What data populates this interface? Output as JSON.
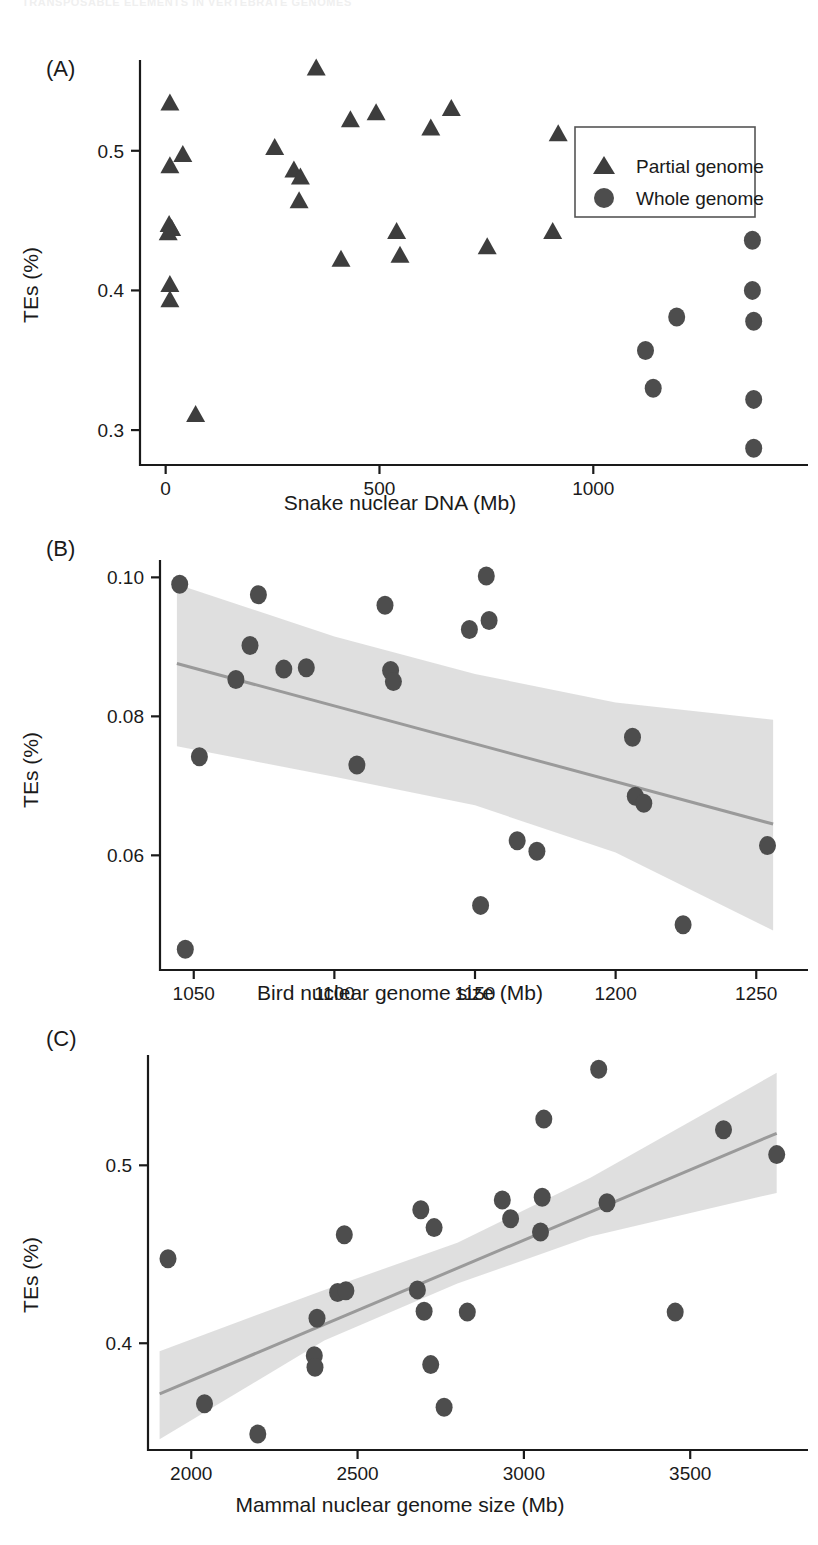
{
  "running_head": "TRANSPOSABLE ELEMENTS IN VERTEBRATE GENOMES",
  "figure": {
    "panels": [
      {
        "tag": "(A)",
        "xlabel": "Snake nuclear DNA (Mb)",
        "ylabel": "TEs (%)",
        "xticks": [
          "0",
          "500",
          "1000"
        ],
        "yticks": [
          "0.5",
          "0.4",
          "0.3"
        ],
        "legend": {
          "items": [
            {
              "label": "Partial genome",
              "marker": "triangle-marker"
            },
            {
              "label": "Whole genome",
              "marker": "circle-marker"
            }
          ]
        }
      },
      {
        "tag": "(B)",
        "xlabel": "Bird nuclear genome size (Mb)",
        "ylabel": "TEs (%)",
        "xticks": [
          "1050",
          "1100",
          "1150",
          "1200",
          "1250"
        ],
        "yticks": [
          "0.10",
          "0.08",
          "0.06"
        ]
      },
      {
        "tag": "(C)",
        "xlabel": "Mammal nuclear genome size (Mb)",
        "ylabel": "TEs (%)",
        "xticks": [
          "2000",
          "2500",
          "3000",
          "3500"
        ],
        "yticks": [
          "0.5",
          "0.4"
        ]
      }
    ]
  },
  "colors": {
    "marker": "#4d4d4d",
    "fit_line": "#9a9a9a",
    "ci_band": "#d9d9d9",
    "axis": "#1a1a1a"
  },
  "chart_data": [
    {
      "type": "scatter",
      "title": "(A)",
      "xlabel": "Snake nuclear DNA (Mb)",
      "ylabel": "TEs (%)",
      "xlim": [
        -60,
        1460
      ],
      "ylim": [
        0.275,
        0.565
      ],
      "xticks": [
        0,
        500,
        1000
      ],
      "yticks": [
        0.3,
        0.4,
        0.5
      ],
      "grid": false,
      "legend_position": "top-right",
      "series": [
        {
          "name": "Partial genome",
          "marker": "triangle",
          "points": [
            [
              10,
              0.534
            ],
            [
              10,
              0.489
            ],
            [
              40,
              0.497
            ],
            [
              8,
              0.447
            ],
            [
              14,
              0.444
            ],
            [
              6,
              0.441
            ],
            [
              10,
              0.404
            ],
            [
              10,
              0.393
            ],
            [
              70,
              0.311
            ],
            [
              255,
              0.502
            ],
            [
              300,
              0.486
            ],
            [
              315,
              0.481
            ],
            [
              312,
              0.464
            ],
            [
              352,
              0.559
            ],
            [
              410,
              0.422
            ],
            [
              432,
              0.522
            ],
            [
              492,
              0.527
            ],
            [
              540,
              0.442
            ],
            [
              548,
              0.425
            ],
            [
              620,
              0.516
            ],
            [
              668,
              0.53
            ],
            [
              752,
              0.431
            ],
            [
              905,
              0.442
            ],
            [
              918,
              0.512
            ]
          ]
        },
        {
          "name": "Whole genome",
          "marker": "circle",
          "points": [
            [
              1122,
              0.357
            ],
            [
              1140,
              0.33
            ],
            [
              1195,
              0.381
            ],
            [
              1372,
              0.436
            ],
            [
              1372,
              0.4
            ],
            [
              1375,
              0.378
            ],
            [
              1375,
              0.322
            ],
            [
              1375,
              0.287
            ]
          ]
        }
      ]
    },
    {
      "type": "scatter",
      "title": "(B)",
      "xlabel": "Bird nuclear genome size (Mb)",
      "ylabel": "TEs (%)",
      "xlim": [
        1038,
        1262
      ],
      "ylim": [
        0.0435,
        0.1025
      ],
      "xticks": [
        1050,
        1100,
        1150,
        1200,
        1250
      ],
      "yticks": [
        0.06,
        0.08,
        0.1
      ],
      "grid": false,
      "regression": {
        "line": [
          [
            1044,
            0.0876
          ],
          [
            1256,
            0.0645
          ]
        ],
        "ci_upper": [
          [
            1044,
            0.099
          ],
          [
            1100,
            0.0915
          ],
          [
            1150,
            0.0861
          ],
          [
            1200,
            0.082
          ],
          [
            1256,
            0.0795
          ]
        ],
        "ci_lower": [
          [
            1044,
            0.0757
          ],
          [
            1100,
            0.0713
          ],
          [
            1150,
            0.0672
          ],
          [
            1200,
            0.0604
          ],
          [
            1256,
            0.0492
          ]
        ]
      },
      "series": [
        {
          "name": "Whole genome",
          "marker": "circle",
          "points": [
            [
              1045,
              0.099
            ],
            [
              1047,
              0.0465
            ],
            [
              1052,
              0.0742
            ],
            [
              1065,
              0.0853
            ],
            [
              1070,
              0.0902
            ],
            [
              1073,
              0.0975
            ],
            [
              1082,
              0.0868
            ],
            [
              1090,
              0.087
            ],
            [
              1108,
              0.073
            ],
            [
              1118,
              0.096
            ],
            [
              1120,
              0.0866
            ],
            [
              1121,
              0.085
            ],
            [
              1148,
              0.0925
            ],
            [
              1152,
              0.0528
            ],
            [
              1154,
              0.1002
            ],
            [
              1155,
              0.0938
            ],
            [
              1165,
              0.0621
            ],
            [
              1172,
              0.0606
            ],
            [
              1206,
              0.077
            ],
            [
              1207,
              0.0685
            ],
            [
              1210,
              0.0675
            ],
            [
              1224,
              0.05
            ],
            [
              1254,
              0.0614
            ]
          ]
        }
      ]
    },
    {
      "type": "scatter",
      "title": "(C)",
      "xlabel": "Mammal nuclear genome size (Mb)",
      "ylabel": "TEs (%)",
      "xlim": [
        1870,
        3800
      ],
      "ylim": [
        0.34,
        0.562
      ],
      "xticks": [
        2000,
        2500,
        3000,
        3500
      ],
      "yticks": [
        0.4,
        0.5
      ],
      "grid": false,
      "regression": {
        "line": [
          [
            1905,
            0.3715
          ],
          [
            3760,
            0.518
          ]
        ],
        "ci_upper": [
          [
            1905,
            0.3955
          ],
          [
            2400,
            0.43
          ],
          [
            2800,
            0.4565
          ],
          [
            3200,
            0.493
          ],
          [
            3760,
            0.552
          ]
        ],
        "ci_lower": [
          [
            1905,
            0.346
          ],
          [
            2400,
            0.4015
          ],
          [
            2800,
            0.4335
          ],
          [
            3200,
            0.46
          ],
          [
            3760,
            0.4845
          ]
        ]
      },
      "series": [
        {
          "name": "Whole genome",
          "marker": "circle",
          "points": [
            [
              1930,
              0.4475
            ],
            [
              2040,
              0.366
            ],
            [
              2200,
              0.349
            ],
            [
              2370,
              0.393
            ],
            [
              2372,
              0.3865
            ],
            [
              2378,
              0.414
            ],
            [
              2440,
              0.4285
            ],
            [
              2460,
              0.461
            ],
            [
              2465,
              0.4295
            ],
            [
              2680,
              0.43
            ],
            [
              2690,
              0.475
            ],
            [
              2700,
              0.418
            ],
            [
              2720,
              0.388
            ],
            [
              2730,
              0.465
            ],
            [
              2760,
              0.364
            ],
            [
              2830,
              0.4175
            ],
            [
              2935,
              0.4805
            ],
            [
              2960,
              0.47
            ],
            [
              3050,
              0.4625
            ],
            [
              3055,
              0.482
            ],
            [
              3060,
              0.526
            ],
            [
              3225,
              0.554
            ],
            [
              3250,
              0.479
            ],
            [
              3455,
              0.4175
            ],
            [
              3600,
              0.52
            ],
            [
              3760,
              0.506
            ]
          ]
        }
      ]
    }
  ]
}
